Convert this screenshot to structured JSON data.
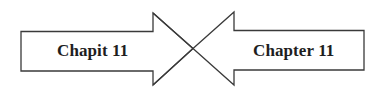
{
  "diagram": {
    "type": "opposing-arrows",
    "stroke_color": "#3a3a3a",
    "fill_color": "#ffffff",
    "text_color": "#1e1e1e",
    "left_arrow": {
      "direction": "right",
      "label": "Chapit 11"
    },
    "right_arrow": {
      "direction": "left",
      "label": "Chapter 11"
    }
  }
}
